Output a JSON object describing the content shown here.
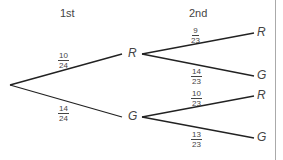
{
  "headers": {
    "first": "1st",
    "second": "2nd"
  },
  "stage1": {
    "R": {
      "label": "R",
      "prob": {
        "num": "10",
        "den": "24"
      }
    },
    "G": {
      "label": "G",
      "prob": {
        "num": "14",
        "den": "24"
      }
    }
  },
  "stage2": {
    "RR": {
      "label": "R",
      "prob": {
        "num": "9",
        "den": "23"
      }
    },
    "RG": {
      "label": "G",
      "prob": {
        "num": "14",
        "den": "23"
      }
    },
    "GR": {
      "label": "R",
      "prob": {
        "num": "10",
        "den": "23"
      }
    },
    "GG": {
      "label": "G",
      "prob": {
        "num": "13",
        "den": "23"
      }
    }
  },
  "colors": {
    "line": "#222222",
    "text": "#444444",
    "divider": "#aaaaaa"
  }
}
